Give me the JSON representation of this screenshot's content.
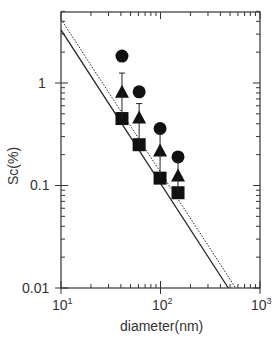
{
  "chart_data": {
    "type": "scatter",
    "title": "",
    "xlabel": "diameter(nm)",
    "ylabel": "Sc(%)",
    "xscale": "log",
    "yscale": "log",
    "xlim": [
      10,
      1000
    ],
    "ylim": [
      0.01,
      5
    ],
    "x_ticks": [
      "10^1",
      "10^2",
      "10^3"
    ],
    "y_ticks": [
      "0.01",
      "0.1",
      "1"
    ],
    "grid": false,
    "legend": null,
    "x": [
      41,
      61,
      99,
      150
    ],
    "series": [
      {
        "name": "circle",
        "marker": "circle",
        "values": [
          1.83,
          0.82,
          0.36,
          0.19
        ]
      },
      {
        "name": "triangle",
        "marker": "triangle",
        "values": [
          0.82,
          0.46,
          0.22,
          0.125
        ],
        "error_upper": [
          1.25,
          0.63,
          0.32,
          0.17
        ]
      },
      {
        "name": "square",
        "marker": "square",
        "values": [
          0.45,
          0.25,
          0.118,
          0.085
        ]
      }
    ],
    "lines": [
      {
        "name": "solid-fit",
        "style": "solid",
        "from": [
          10,
          3.3
        ],
        "to": [
          480,
          0.01
        ]
      },
      {
        "name": "dotted-fit",
        "style": "dotted",
        "from": [
          10,
          4.2
        ],
        "to": [
          570,
          0.01
        ]
      }
    ]
  },
  "axes": {
    "x_tick_labels": [
      {
        "base": "10",
        "exp": "1"
      },
      {
        "base": "10",
        "exp": "2"
      },
      {
        "base": "10",
        "exp": "3"
      }
    ],
    "y_tick_labels": [
      "1",
      "0.1",
      "0.01"
    ]
  }
}
